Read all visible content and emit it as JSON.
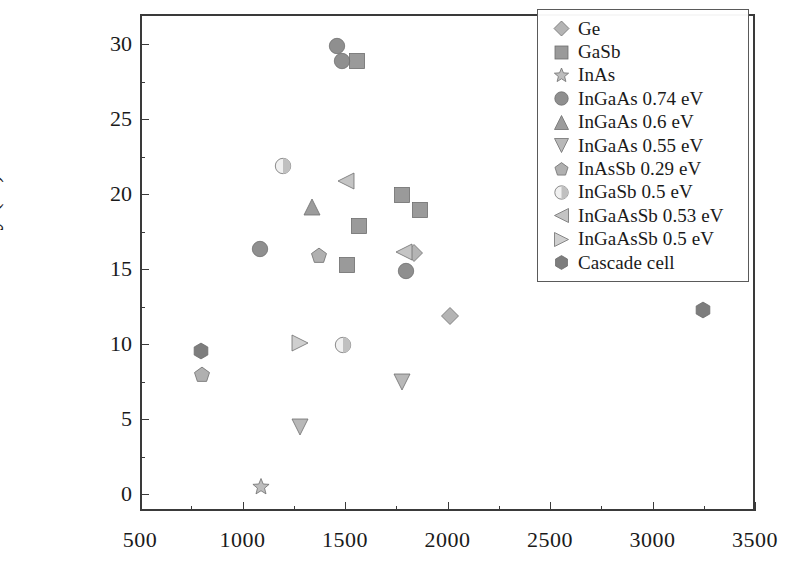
{
  "chart_data": {
    "type": "scatter",
    "title": "",
    "xlabel": "",
    "ylabel": "Efficiency (%)",
    "xlim": [
      500,
      3500
    ],
    "ylim": [
      -1.1,
      32
    ],
    "xticks": [
      500,
      1000,
      1500,
      2000,
      2500,
      3000,
      3500
    ],
    "xtick_labels": [
      "500",
      "1000",
      "1500",
      "2000",
      "2500",
      "3000",
      "3500"
    ],
    "xminor_step": 250,
    "yticks": [
      0,
      5,
      10,
      15,
      20,
      25,
      30
    ],
    "ytick_labels": [
      "0",
      "5",
      "10",
      "15",
      "20",
      "25",
      "30"
    ],
    "yminor_step": 2.5,
    "grid": false,
    "legend_position": "upper right",
    "series": [
      {
        "name": "Ge",
        "marker": "diamond",
        "color": "#b4b4b4",
        "points": [
          {
            "x": 1825,
            "y": 16.2
          },
          {
            "x": 2000,
            "y": 12.0
          }
        ]
      },
      {
        "name": "GaSb",
        "marker": "square",
        "color": "#9a9a9a",
        "points": [
          {
            "x": 1550,
            "y": 29.0
          },
          {
            "x": 1500,
            "y": 15.4
          },
          {
            "x": 1560,
            "y": 18.0
          },
          {
            "x": 1770,
            "y": 20.1
          },
          {
            "x": 1855,
            "y": 19.1
          }
        ]
      },
      {
        "name": "InAs",
        "marker": "star",
        "color": "#bdbdbd",
        "points": [
          {
            "x": 1080,
            "y": 0.6
          }
        ]
      },
      {
        "name": "InGaAs 0.74 eV",
        "marker": "circle",
        "color": "#8f8f8f",
        "points": [
          {
            "x": 1450,
            "y": 30.0
          },
          {
            "x": 1475,
            "y": 29.0
          },
          {
            "x": 1075,
            "y": 16.5
          },
          {
            "x": 1790,
            "y": 15.0
          }
        ]
      },
      {
        "name": "InGaAs 0.6 eV",
        "marker": "triangle-up",
        "color": "#9c9c9c",
        "points": [
          {
            "x": 1330,
            "y": 19.3
          }
        ]
      },
      {
        "name": "InGaAs 0.55 eV",
        "marker": "triangle-down",
        "color": "#b8b8b8",
        "points": [
          {
            "x": 1770,
            "y": 7.6
          },
          {
            "x": 1270,
            "y": 4.6
          }
        ]
      },
      {
        "name": "InAsSb 0.29 eV",
        "marker": "pentagon",
        "color": "#b0b0b0",
        "points": [
          {
            "x": 1365,
            "y": 16.0
          },
          {
            "x": 795,
            "y": 8.1
          }
        ]
      },
      {
        "name": "InGaSb 0.5 eV",
        "marker": "half-circle",
        "color": "#c0c0c0",
        "points": [
          {
            "x": 1190,
            "y": 22.0
          },
          {
            "x": 1480,
            "y": 10.1
          }
        ]
      },
      {
        "name": "InGaAsSb 0.53 eV",
        "marker": "triangle-left",
        "color": "#c4c4c4",
        "points": [
          {
            "x": 1495,
            "y": 21.0
          },
          {
            "x": 1780,
            "y": 16.3
          }
        ]
      },
      {
        "name": "InGaAsSb 0.5 eV",
        "marker": "triangle-right",
        "color": "#cfcfcf",
        "points": [
          {
            "x": 1270,
            "y": 10.2
          }
        ]
      },
      {
        "name": "Cascade cell",
        "marker": "hexagon",
        "color": "#7d7d7d",
        "points": [
          {
            "x": 790,
            "y": 9.7
          },
          {
            "x": 3235,
            "y": 12.4
          }
        ]
      }
    ]
  },
  "axes": {
    "y_title": "Efficiency (%)"
  },
  "legend": {
    "entries": [
      {
        "label": "Ge",
        "marker": "diamond",
        "color": "#b4b4b4"
      },
      {
        "label": "GaSb",
        "marker": "square",
        "color": "#9a9a9a"
      },
      {
        "label": "InAs",
        "marker": "star",
        "color": "#bdbdbd"
      },
      {
        "label": "InGaAs 0.74 eV",
        "marker": "circle",
        "color": "#8f8f8f"
      },
      {
        "label": "InGaAs 0.6 eV",
        "marker": "triangle-up",
        "color": "#9c9c9c"
      },
      {
        "label": "InGaAs 0.55 eV",
        "marker": "triangle-down",
        "color": "#b8b8b8"
      },
      {
        "label": "InAsSb 0.29 eV",
        "marker": "pentagon",
        "color": "#b0b0b0"
      },
      {
        "label": "InGaSb 0.5 eV",
        "marker": "half-circle",
        "color": "#c0c0c0"
      },
      {
        "label": "InGaAsSb 0.53 eV",
        "marker": "triangle-left",
        "color": "#c4c4c4"
      },
      {
        "label": "InGaAsSb 0.5 eV",
        "marker": "triangle-right",
        "color": "#cfcfcf"
      },
      {
        "label": "Cascade cell",
        "marker": "hexagon",
        "color": "#7d7d7d"
      }
    ]
  }
}
